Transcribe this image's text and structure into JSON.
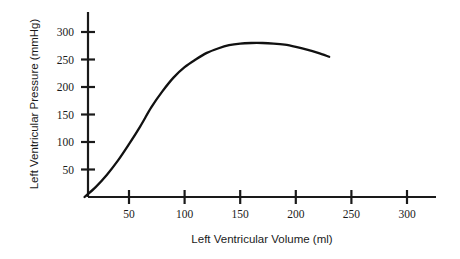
{
  "chart_data": {
    "type": "line",
    "title": "",
    "subtitle": "",
    "xlabel": "Left Ventricular Volume (ml)",
    "ylabel": "Left Ventricular Pressure (mmHg)",
    "xlim": [
      0,
      325
    ],
    "ylim": [
      0,
      330
    ],
    "xticks": [
      50,
      100,
      150,
      200,
      250,
      300
    ],
    "xtick_labels": [
      "50",
      "100",
      "150",
      "200",
      "250",
      "300"
    ],
    "yticks": [
      50,
      100,
      150,
      200,
      250,
      300
    ],
    "ytick_labels": [
      "50",
      "100",
      "150",
      "200",
      "250",
      "300"
    ],
    "grid": false,
    "legend": false,
    "legend_position": "none",
    "annotations": [],
    "series": [
      {
        "name": "Left ventricular pressure-volume curve",
        "color": "#111111",
        "x": [
          10,
          20,
          30,
          40,
          50,
          60,
          70,
          80,
          90,
          100,
          110,
          120,
          130,
          140,
          150,
          160,
          170,
          180,
          190,
          200,
          210,
          220,
          230
        ],
        "values": [
          0,
          18,
          40,
          66,
          96,
          128,
          163,
          192,
          217,
          236,
          250,
          262,
          270,
          276,
          279,
          280,
          280,
          279,
          277,
          273,
          268,
          262,
          255
        ]
      }
    ]
  },
  "axis": {
    "x_label": "Left Ventricular Volume (ml)",
    "y_label": "Left Ventricular Pressure (mmHg)"
  }
}
